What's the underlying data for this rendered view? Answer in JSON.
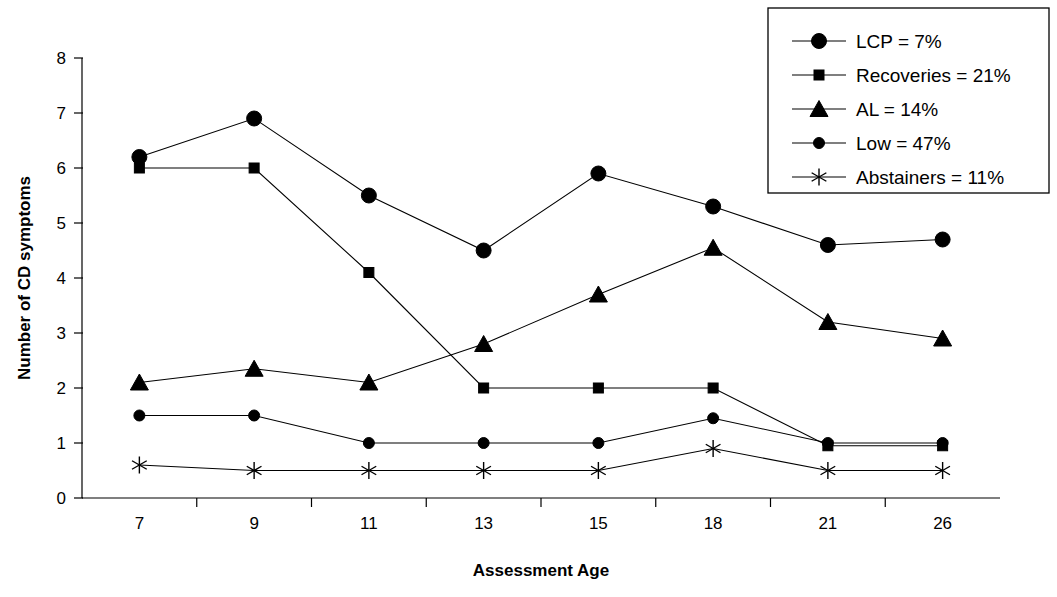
{
  "chart_data": {
    "type": "line",
    "title": "",
    "xlabel": "Assessment Age",
    "ylabel": "Number of CD symptoms",
    "categories": [
      "7",
      "9",
      "11",
      "13",
      "15",
      "18",
      "21",
      "26"
    ],
    "x_tick_labels": [
      "7",
      "9",
      "11",
      "13",
      "15",
      "18",
      "21",
      "26"
    ],
    "y_tick_labels": [
      "0",
      "1",
      "2",
      "3",
      "4",
      "5",
      "6",
      "7",
      "8"
    ],
    "ylim": [
      0,
      8
    ],
    "grid": false,
    "legend_position": "top-right",
    "series": [
      {
        "name": "LCP = 7%",
        "short_name": "LCP",
        "percent": "7%",
        "marker": "circle-large",
        "values": [
          6.2,
          6.9,
          5.5,
          4.5,
          5.9,
          5.3,
          4.6,
          4.7
        ]
      },
      {
        "name": "Recoveries = 21%",
        "short_name": "Recoveries",
        "percent": "21%",
        "marker": "square",
        "values": [
          6.0,
          6.0,
          4.1,
          2.0,
          2.0,
          2.0,
          0.95,
          0.95
        ]
      },
      {
        "name": "AL = 14%",
        "short_name": "AL",
        "percent": "14%",
        "marker": "triangle",
        "values": [
          2.1,
          2.35,
          2.1,
          2.8,
          3.7,
          4.55,
          3.2,
          2.9
        ]
      },
      {
        "name": "Low = 47%",
        "short_name": "Low",
        "percent": "47%",
        "marker": "circle-small",
        "values": [
          1.5,
          1.5,
          1.0,
          1.0,
          1.0,
          1.45,
          1.0,
          1.0
        ]
      },
      {
        "name": "Abstainers = 11%",
        "short_name": "Abstainers",
        "percent": "11%",
        "marker": "star",
        "values": [
          0.6,
          0.5,
          0.5,
          0.5,
          0.5,
          0.9,
          0.5,
          0.5
        ]
      }
    ],
    "colors": {
      "line": "#000000",
      "marker": "#000000",
      "axis": "#000000",
      "background": "#ffffff"
    }
  },
  "legend": {
    "items": [
      {
        "label": "LCP = 7%",
        "icon": "circle-large-marker-icon"
      },
      {
        "label": "Recoveries = 21%",
        "icon": "square-marker-icon"
      },
      {
        "label": "AL = 14%",
        "icon": "triangle-marker-icon"
      },
      {
        "label": "Low = 47%",
        "icon": "circle-small-marker-icon"
      },
      {
        "label": "Abstainers = 11%",
        "icon": "star-marker-icon"
      }
    ]
  },
  "axes": {
    "x_title": "Assessment Age",
    "y_title": "Number of CD symptoms"
  }
}
